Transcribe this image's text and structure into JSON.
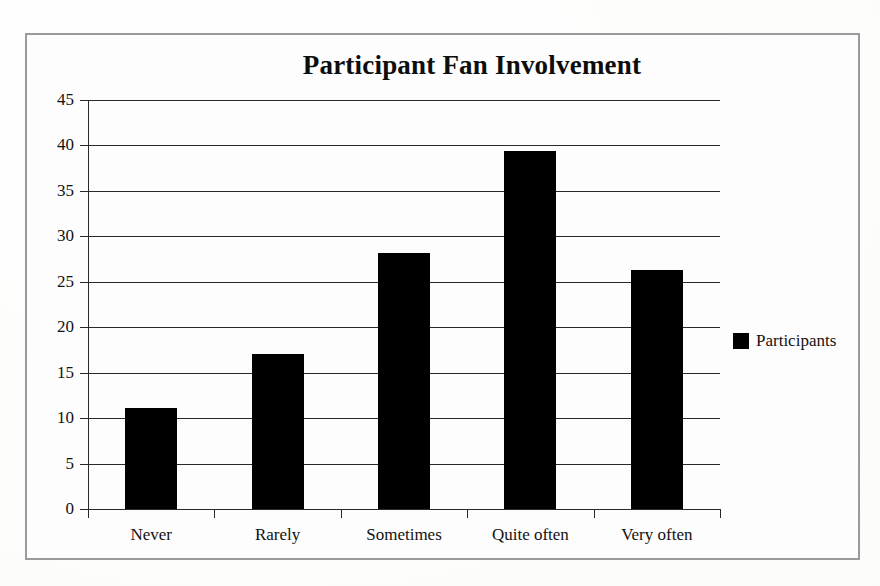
{
  "figure": {
    "border_color": "#9a9a9a",
    "background_color": "#fdfdfd"
  },
  "legend": {
    "position": "right",
    "swatch_name": "legend-color-swatch",
    "entries": [
      {
        "label": "Participants",
        "color": "#000000"
      }
    ]
  },
  "chart_data": {
    "type": "bar",
    "title": "Participant Fan Involvement",
    "xlabel": "",
    "ylabel": "",
    "categories": [
      "Never",
      "Rarely",
      "Sometimes",
      "Quite often",
      "Very often"
    ],
    "series": [
      {
        "name": "Participants",
        "color": "#000000",
        "values": [
          11.1,
          17.1,
          28.2,
          39.4,
          26.3
        ]
      }
    ],
    "ylim": [
      0,
      45
    ],
    "ytick_values": [
      0,
      5,
      10,
      15,
      20,
      25,
      30,
      35,
      40,
      45
    ],
    "ytick_labels": [
      "0",
      "5",
      "10",
      "15",
      "20",
      "25",
      "30",
      "35",
      "40",
      "45"
    ],
    "grid": true,
    "grid_axis": "y",
    "legend": [
      "Participants"
    ],
    "legend_position": "right",
    "annotations": []
  }
}
